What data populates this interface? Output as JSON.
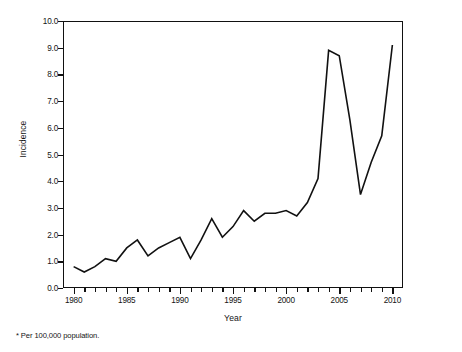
{
  "figure": {
    "footnote": "* Per 100,000 population."
  },
  "axes": {
    "x_title": "Year",
    "y_title": "Incidence",
    "y_tick_labels": [
      "0.0",
      "1.0",
      "2.0",
      "3.0",
      "4.0",
      "5.0",
      "6.0",
      "7.0",
      "8.0",
      "9.0",
      "10.0"
    ],
    "x_tick_labels": [
      "1980",
      "1985",
      "1990",
      "1995",
      "2000",
      "2005",
      "2010"
    ]
  },
  "chart_data": {
    "type": "line",
    "title": "",
    "subtitle": "",
    "xlabel": "Year",
    "ylabel": "Incidence",
    "annotations": [
      "* Per 100,000 population."
    ],
    "grid": false,
    "legend": "none",
    "xlim": [
      1979,
      2011
    ],
    "ylim": [
      0.0,
      10.0
    ],
    "x_ticks": [
      1980,
      1985,
      1990,
      1995,
      2000,
      2005,
      2010
    ],
    "y_ticks": [
      0.0,
      1.0,
      2.0,
      3.0,
      4.0,
      5.0,
      6.0,
      7.0,
      8.0,
      9.0,
      10.0
    ],
    "x": [
      1980,
      1981,
      1982,
      1983,
      1984,
      1985,
      1986,
      1987,
      1988,
      1989,
      1990,
      1991,
      1992,
      1993,
      1994,
      1995,
      1996,
      1997,
      1998,
      1999,
      2000,
      2001,
      2002,
      2003,
      2004,
      2005,
      2006,
      2007,
      2008,
      2009,
      2010
    ],
    "series": [
      {
        "name": "Incidence",
        "color": "#111111",
        "values": [
          0.8,
          0.6,
          0.8,
          1.1,
          1.0,
          1.5,
          1.8,
          1.2,
          1.5,
          1.7,
          1.9,
          1.1,
          1.8,
          2.6,
          1.9,
          2.3,
          2.9,
          2.5,
          2.8,
          2.8,
          2.9,
          2.7,
          3.2,
          4.1,
          8.9,
          8.7,
          6.3,
          3.5,
          4.7,
          5.7,
          9.1
        ]
      }
    ]
  }
}
